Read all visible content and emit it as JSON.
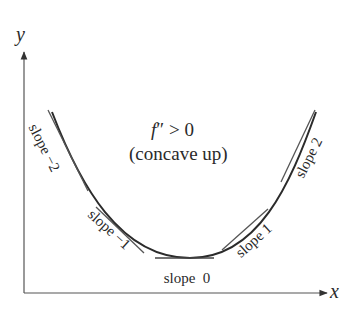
{
  "diagram": {
    "title_line1_f": "f",
    "title_line1_rest": "″ > 0",
    "title_line2": "(concave up)",
    "axes": {
      "x_label": "x",
      "y_label": "y"
    },
    "tangents": [
      {
        "label": "slope −2",
        "slope": -2
      },
      {
        "label": "slope −1",
        "slope": -1
      },
      {
        "label": "slope  0",
        "slope": 0
      },
      {
        "label": "slope 1",
        "slope": 1
      },
      {
        "label": "slope 2",
        "slope": 2
      }
    ],
    "colors": {
      "curve": "#2b2b2b",
      "tangent": "#555555",
      "axis": "#444444",
      "text": "#2a2a2a"
    }
  }
}
